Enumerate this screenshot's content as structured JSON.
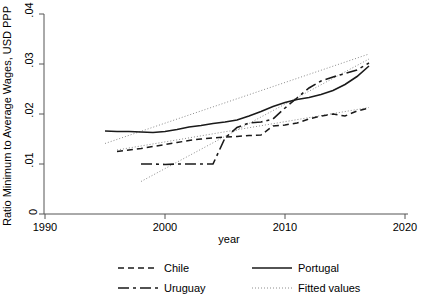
{
  "chart_data": {
    "type": "line",
    "title": "",
    "xlabel": "year",
    "ylabel": "Ratio Minimum to Average Wages, USD PPP",
    "xlim": [
      1990,
      2020
    ],
    "ylim": [
      0,
      0.04
    ],
    "xticks": [
      "1990",
      "2000",
      "2010",
      "2020"
    ],
    "xtick_values": [
      1990,
      2000,
      2010,
      2020
    ],
    "yticks": [
      "0",
      ".01",
      ".02",
      ".03",
      ".04"
    ],
    "ytick_values": [
      0,
      0.01,
      0.02,
      0.03,
      0.04
    ],
    "grid": false,
    "legend_position": "below",
    "series": [
      {
        "name": "Chile",
        "style": "dashed",
        "color": "#1a1a1a",
        "x": [
          1996,
          1997,
          1998,
          1999,
          2000,
          2001,
          2002,
          2003,
          2004,
          2005,
          2006,
          2007,
          2008,
          2009,
          2010,
          2011,
          2012,
          2013,
          2014,
          2015,
          2016,
          2017
        ],
        "y": [
          0.0125,
          0.0128,
          0.0131,
          0.0135,
          0.0139,
          0.0143,
          0.0147,
          0.015,
          0.0152,
          0.0154,
          0.0155,
          0.0157,
          0.0158,
          0.0176,
          0.0178,
          0.0182,
          0.019,
          0.0196,
          0.02,
          0.0196,
          0.0206,
          0.0212
        ]
      },
      {
        "name": "Portugal",
        "style": "solid",
        "color": "#1a1a1a",
        "x": [
          1995,
          1996,
          1997,
          1998,
          1999,
          2000,
          2001,
          2002,
          2003,
          2004,
          2005,
          2006,
          2007,
          2008,
          2009,
          2010,
          2011,
          2012,
          2013,
          2014,
          2015,
          2016,
          2017
        ],
        "y": [
          0.0166,
          0.0165,
          0.0165,
          0.0164,
          0.0163,
          0.0165,
          0.0169,
          0.0174,
          0.0177,
          0.0181,
          0.0184,
          0.0188,
          0.0196,
          0.0205,
          0.0215,
          0.0223,
          0.0229,
          0.0233,
          0.0239,
          0.0247,
          0.0259,
          0.0275,
          0.0296
        ]
      },
      {
        "name": "Uruguay",
        "style": "longdash",
        "color": "#1a1a1a",
        "x": [
          1998,
          1999,
          2000,
          2001,
          2002,
          2003,
          2004,
          2005,
          2006,
          2007,
          2008,
          2009,
          2010,
          2011,
          2012,
          2013,
          2014,
          2015,
          2016,
          2017
        ],
        "y": [
          0.01,
          0.01,
          0.0099,
          0.01,
          0.01,
          0.01,
          0.01,
          0.0152,
          0.0173,
          0.0182,
          0.0184,
          0.019,
          0.0212,
          0.0232,
          0.0252,
          0.0266,
          0.0274,
          0.0281,
          0.0288,
          0.0302
        ]
      },
      {
        "name": "Fitted values",
        "style": "dotted",
        "color": "#8c8c8c",
        "note": "Three linear fitted trend lines, one per country"
      }
    ],
    "fitted_lines": [
      {
        "for": "Chile",
        "x": [
          1996,
          2017
        ],
        "y": [
          0.0128,
          0.0213
        ]
      },
      {
        "for": "Portugal",
        "x": [
          1995,
          2017
        ],
        "y": [
          0.0141,
          0.032
        ]
      },
      {
        "for": "Uruguay",
        "x": [
          1998,
          2017
        ],
        "y": [
          0.0065,
          0.031
        ]
      }
    ],
    "legend": [
      {
        "label": "Chile",
        "style": "dashed",
        "column": 1,
        "row": 1
      },
      {
        "label": "Portugal",
        "style": "solid",
        "column": 2,
        "row": 1
      },
      {
        "label": "Uruguay",
        "style": "longdash",
        "column": 1,
        "row": 2
      },
      {
        "label": "Fitted values",
        "style": "dotted",
        "column": 2,
        "row": 2
      }
    ],
    "colors": {
      "series_line": "#1a1a1a",
      "fitted_line": "#8c8c8c",
      "axis": "#555555",
      "background": "#ffffff"
    }
  }
}
